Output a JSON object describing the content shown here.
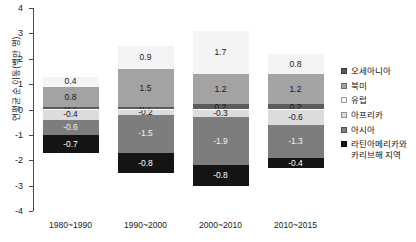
{
  "chart_data": {
    "type": "bar",
    "subtype": "stacked-diverging",
    "title": "",
    "xlabel": "",
    "ylabel": "연평균 순 이동(백만 명)",
    "categories": [
      "1980~1990",
      "1990~2000",
      "2000~2010",
      "2010~2015"
    ],
    "ylim": [
      -4,
      4
    ],
    "ytick_labels": [
      "4",
      "3",
      "2",
      "1",
      "0",
      "-1",
      "-2",
      "-3",
      "-4"
    ],
    "ytick_values": [
      4,
      3,
      2,
      1,
      0,
      -1,
      -2,
      -3,
      -4
    ],
    "grid": false,
    "legend_position": "right",
    "series": [
      {
        "name": "오세아니아",
        "color": "#5b5b5b",
        "values": [
          0.1,
          0.1,
          0.2,
          0.2
        ],
        "labels": [
          "0.1",
          "0.1",
          "0.2",
          "0.2"
        ],
        "label_color": "#1a1a1a"
      },
      {
        "name": "북미",
        "color": "#a3a3a3",
        "values": [
          0.8,
          1.5,
          1.2,
          1.2
        ],
        "labels": [
          "0.8",
          "1.5",
          "1.2",
          "1.2"
        ],
        "label_color": "#1a1a1a"
      },
      {
        "name": "유럽",
        "color": "#f4f4f4",
        "values": [
          0.4,
          0.9,
          1.7,
          0.8
        ],
        "labels": [
          "0.4",
          "0.9",
          "1.7",
          "0.8"
        ],
        "label_color": "#1a1a1a"
      },
      {
        "name": "아프리카",
        "color": "#dcdcdc",
        "values": [
          -0.4,
          -0.2,
          -0.3,
          -0.6
        ],
        "labels": [
          "-0.4",
          "-0.2",
          "-0.3",
          "-0.6"
        ],
        "label_color": "#1a1a1a"
      },
      {
        "name": "아시아",
        "color": "#7d7d7d",
        "values": [
          -0.6,
          -1.5,
          -1.9,
          -1.3
        ],
        "labels": [
          "-0.6",
          "-1.5",
          "-1.9",
          "-1.3"
        ],
        "label_color": "#f0f0f0"
      },
      {
        "name": "라틴아메리카와\n카리브해 지역",
        "color": "#141414",
        "values": [
          -0.7,
          -0.8,
          -0.8,
          -0.4
        ],
        "labels": [
          "-0.7",
          "-0.8",
          "-0.8",
          "-0.4"
        ],
        "label_color": "#ffffff"
      }
    ]
  }
}
